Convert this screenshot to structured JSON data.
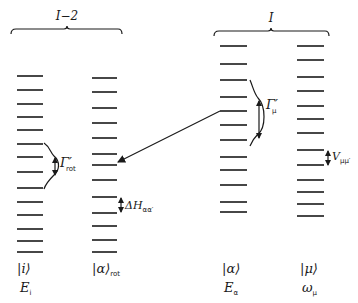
{
  "diagram": {
    "groups": [
      {
        "label": "I−2",
        "x1": 11,
        "x2": 122,
        "y": 30,
        "label_x": 67
      },
      {
        "label": "I",
        "x1": 214,
        "x2": 329,
        "y": 32,
        "label_x": 271
      }
    ],
    "columns": [
      {
        "id": "i",
        "ket": "|i⟩",
        "ket_sub": "",
        "energy": "E",
        "energy_sub": "i",
        "x1": 17,
        "x2": 43,
        "levels": [
          76,
          90,
          104,
          117,
          130,
          144,
          157,
          172,
          188,
          202,
          215,
          229,
          241,
          252
        ]
      },
      {
        "id": "alpha-rot",
        "ket": "|α⟩",
        "ket_sub": "rot",
        "energy": "",
        "energy_sub": "",
        "x1": 92,
        "x2": 117,
        "levels": [
          78,
          92,
          108,
          123,
          138,
          154,
          165,
          180,
          197,
          213,
          226,
          240,
          252
        ]
      },
      {
        "id": "alpha",
        "ket": "|α⟩",
        "ket_sub": "",
        "energy": "E",
        "energy_sub": "α",
        "x1": 220,
        "x2": 247,
        "levels": [
          46,
          64,
          80,
          97,
          111,
          125,
          140,
          157,
          170,
          185,
          202,
          212
        ]
      },
      {
        "id": "mu",
        "ket": "|μ⟩",
        "ket_sub": "",
        "energy": "ω",
        "energy_sub": "μ",
        "x1": 297,
        "x2": 324,
        "levels": [
          46,
          60,
          77,
          91,
          106,
          119,
          133,
          150,
          165,
          180,
          192,
          204,
          216
        ]
      }
    ],
    "annotations": {
      "gamma_rot": {
        "symbol": "Γ′",
        "sub": "rot"
      },
      "gamma_mu": {
        "symbol": "Γ′",
        "sub": "μ"
      },
      "delta_h": {
        "symbol": "ΔH",
        "sub": "αα′"
      },
      "v_mumu": {
        "symbol": "V",
        "sub": "μμ′"
      }
    },
    "coupling_arrow": {
      "from": [
        220,
        111
      ],
      "to": [
        117,
        162
      ]
    },
    "colors": {
      "ink": "#1a1a1a",
      "background": "#ffffff"
    }
  }
}
